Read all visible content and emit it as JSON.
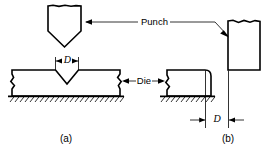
{
  "figure": {
    "background_color": "#ffffff",
    "line_color": "#000000"
  },
  "labels": {
    "punch": "Punch",
    "die": "Die",
    "dimension_a": "D",
    "dimension_b": "D"
  },
  "captions": {
    "a": "(a)",
    "b": "(b)"
  },
  "panels": [
    {
      "id": "a",
      "caption": "(a)",
      "operation": "V-bending",
      "components": [
        "punch",
        "die",
        "ground"
      ],
      "dimension_label": "D",
      "dimension_meaning": "punch tip width / die opening"
    },
    {
      "id": "b",
      "caption": "(b)",
      "operation": "edge-bending",
      "components": [
        "punch",
        "die",
        "ground"
      ],
      "dimension_label": "D",
      "dimension_meaning": "clearance between die and punch"
    }
  ],
  "icons": {
    "arrow": "arrow-head",
    "break": "break-line",
    "hatch": "ground-hatching"
  }
}
